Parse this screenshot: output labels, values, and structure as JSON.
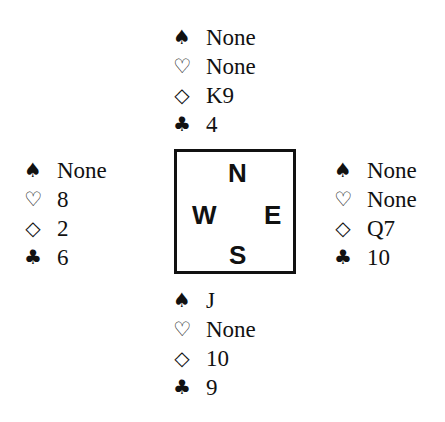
{
  "suit_icons": {
    "spades": "♠",
    "hearts": "♡",
    "diamonds": "◇",
    "clubs": "♣"
  },
  "compass": {
    "north": "N",
    "west": "W",
    "east": "E",
    "south": "S"
  },
  "hands": {
    "north": {
      "spades": "None",
      "hearts": "None",
      "diamonds": "K9",
      "clubs": "4"
    },
    "west": {
      "spades": "None",
      "hearts": "8",
      "diamonds": "2",
      "clubs": "6"
    },
    "east": {
      "spades": "None",
      "hearts": "None",
      "diamonds": "Q7",
      "clubs": "10"
    },
    "south": {
      "spades": "J",
      "hearts": "None",
      "diamonds": "10",
      "clubs": "9"
    }
  },
  "colors": {
    "ink": "#111111",
    "background": "#ffffff"
  }
}
